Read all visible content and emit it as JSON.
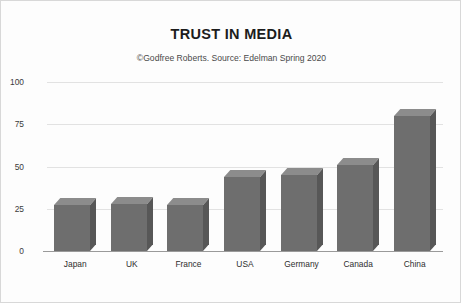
{
  "chart_data": {
    "type": "bar",
    "title": "TRUST IN MEDIA",
    "subtitle": "©Godfree Roberts. Source: Edelman Spring 2020",
    "categories": [
      "Japan",
      "UK",
      "France",
      "USA",
      "Germany",
      "Canada",
      "China"
    ],
    "values": [
      27,
      28,
      27,
      44,
      45,
      51,
      80
    ],
    "series": [
      {
        "name": "Trust in media",
        "values": [
          27,
          28,
          27,
          44,
          45,
          51,
          80
        ]
      }
    ],
    "xlabel": "",
    "ylabel": "",
    "ylim": [
      0,
      100
    ],
    "yticks": [
      0,
      25,
      50,
      75,
      100
    ],
    "ytick_labels": [
      "0",
      "25",
      "50",
      "75",
      "100"
    ],
    "grid": true,
    "legend": false,
    "legend_position": "none",
    "bar_style": "3d",
    "colors": {
      "bar_front": "#6e6e6e",
      "bar_top": "#8c8c8c",
      "bar_side": "#575757",
      "gridline": "#e2e2e2",
      "axis": "#9a9a9a",
      "title_text": "#1c1c1c",
      "subtitle_text": "#4a4a4a",
      "tick_text": "#2e2e2e",
      "background": "#fdfdfd",
      "border": "#d8d8d8"
    }
  }
}
